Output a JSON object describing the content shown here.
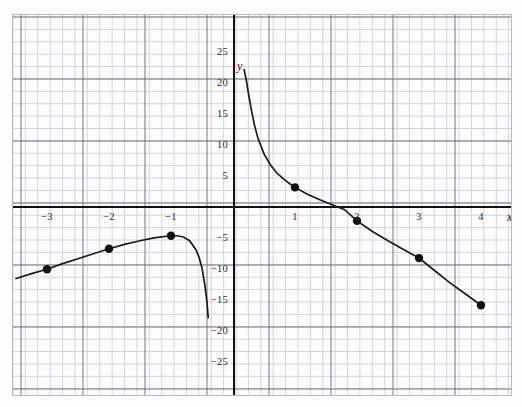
{
  "figure": {
    "kind": "cartesian-graph",
    "background_color": "#fdfdfd",
    "grid_minor_color": "#c6c6cf",
    "grid_major_color": "#6e6e7a",
    "axis_color": "#111111",
    "curve_color": "#1b1b1b"
  },
  "axes": {
    "x_label": "x",
    "y_label": "y"
  },
  "chart_data": {
    "type": "line",
    "title": "",
    "subtitle": "",
    "xlabel": "x",
    "ylabel": "y",
    "xlim": [
      -3.55,
      4.5
    ],
    "ylim": [
      -26.5,
      27.5
    ],
    "grid": true,
    "grid_major_step_x": 1,
    "grid_major_step_y": 5,
    "grid_minor_step_x": 0.2,
    "grid_minor_step_y": 1,
    "legend": "none",
    "x_ticks": [
      -3,
      -2,
      -1,
      1,
      2,
      3,
      4
    ],
    "x_tick_labels": [
      "−3",
      "−2",
      "−1",
      "1",
      "2",
      "3",
      "4"
    ],
    "y_ticks": [
      25,
      20,
      15,
      10,
      5,
      -5,
      -10,
      -15,
      -20,
      -25
    ],
    "y_tick_labels": [
      "25",
      "20",
      "15",
      "10",
      "5",
      "−5",
      "−10",
      "−15",
      "−20",
      "−25"
    ],
    "asymptote_vertical_x": 0,
    "series": [
      {
        "name": "curve-left-branch",
        "x": [
          -3.5,
          -3.25,
          -3,
          -2.75,
          -2.5,
          -2.25,
          -2,
          -1.75,
          -1.5,
          -1.25,
          -1,
          -0.9,
          -0.8,
          -0.7,
          -0.6,
          -0.55,
          -0.5,
          -0.45,
          -0.42,
          -0.4
        ],
        "values": [
          -11.7,
          -10.9,
          -10.2,
          -9.3,
          -8.5,
          -7.7,
          -6.9,
          -6.2,
          -5.6,
          -5.1,
          -4.8,
          -4.8,
          -5.0,
          -5.6,
          -7.0,
          -8.2,
          -10.0,
          -13.0,
          -15.5,
          -18.0
        ]
      },
      {
        "name": "curve-right-branch",
        "x": [
          0.18,
          0.22,
          0.26,
          0.3,
          0.35,
          0.4,
          0.5,
          0.6,
          0.7,
          0.8,
          0.9,
          1,
          1.2,
          1.4,
          1.6,
          1.8,
          2,
          2.25,
          2.5,
          2.75,
          3,
          3.25,
          3.5,
          3.75,
          4
        ],
        "values": [
          22.0,
          20.0,
          17.5,
          15.3,
          12.9,
          11.0,
          8.4,
          6.7,
          5.4,
          4.5,
          3.7,
          3.0,
          1.9,
          1.0,
          0.2,
          -0.6,
          -2.4,
          -4.1,
          -5.6,
          -7.0,
          -8.4,
          -10.4,
          -12.4,
          -14.2,
          -16.0
        ]
      }
    ],
    "points": [
      {
        "label": "point-neg3",
        "x": -3,
        "y": -10.2
      },
      {
        "label": "point-neg2",
        "x": -2,
        "y": -6.9
      },
      {
        "label": "point-neg1",
        "x": -1,
        "y": -4.8
      },
      {
        "label": "point-1",
        "x": 1,
        "y": 3.0
      },
      {
        "label": "point-2",
        "x": 2,
        "y": -2.4
      },
      {
        "label": "point-3",
        "x": 3,
        "y": -8.4
      },
      {
        "label": "point-4",
        "x": 4,
        "y": -16.0
      }
    ]
  }
}
